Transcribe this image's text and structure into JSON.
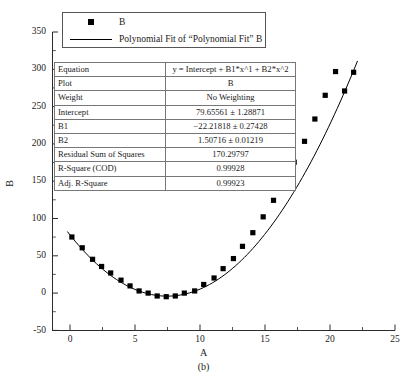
{
  "figure": {
    "caption": "(b)",
    "axis": {
      "xlabel": "A",
      "ylabel": "B",
      "xticks": [
        "0",
        "5",
        "10",
        "15",
        "20",
        "25"
      ],
      "yticks": [
        "350",
        "300",
        "250",
        "200",
        "150",
        "100",
        "50",
        "0",
        "-50"
      ]
    }
  },
  "legend": {
    "entries": [
      {
        "key": "square-marker",
        "label": "B"
      },
      {
        "key": "line",
        "label": "Polynomial Fit of  “Polynomial Fit”  B"
      }
    ]
  },
  "param_table": {
    "rows": [
      {
        "name": "Equation",
        "value": "y = Intercept + B1*x^1 + B2*x^2"
      },
      {
        "name": "Plot",
        "value": "B"
      },
      {
        "name": "Weight",
        "value": "No Weighting"
      },
      {
        "name": "Intercept",
        "value": "79.65561 ± 1.28871"
      },
      {
        "name": "B1",
        "value": "−22.21818 ± 0.27428"
      },
      {
        "name": "B2",
        "value": "1.50716 ± 0.01219"
      },
      {
        "name": "Residual Sum of Squares",
        "value": "170.29797"
      },
      {
        "name": "R-Square (COD)",
        "value": "0.99928"
      },
      {
        "name": "Adj. R-Square",
        "value": "0.99923"
      }
    ]
  },
  "chart_data": {
    "type": "scatter",
    "title": "",
    "xlabel": "A",
    "ylabel": "B",
    "xlim": [
      -1.5,
      25
    ],
    "ylim": [
      -50,
      365
    ],
    "grid": false,
    "legend_position": "top-left",
    "marker": "filled-square",
    "marker_color": "#000000",
    "line_color": "#000000",
    "fit": {
      "model": "y = Intercept + B1*x^1 + B2*x^2",
      "intercept": 79.65561,
      "intercept_err": 1.28871,
      "b1": -22.21818,
      "b1_err": 0.27428,
      "b2": 1.50716,
      "b2_err": 0.01219,
      "residual_sum_of_squares": 170.29797,
      "r_square_cod": 0.99928,
      "adj_r_square": 0.99923
    },
    "series": [
      {
        "name": "B",
        "x": [
          0.0,
          0.8,
          1.6,
          2.3,
          3.0,
          3.8,
          4.5,
          5.2,
          5.9,
          6.6,
          7.3,
          8.0,
          8.7,
          9.5,
          10.2,
          11.0,
          11.7,
          12.5,
          13.2,
          14.0,
          14.8,
          15.6,
          16.4,
          17.2,
          18.0,
          18.8,
          19.6,
          20.4,
          21.1,
          21.8
        ],
        "y": [
          80,
          65,
          49,
          39,
          30,
          20,
          12,
          5,
          2,
          -2,
          -3,
          -2,
          2,
          5,
          14,
          23,
          36,
          50,
          67,
          86,
          108,
          131,
          157,
          184,
          213,
          244,
          277,
          310,
          283,
          309
        ]
      }
    ]
  }
}
